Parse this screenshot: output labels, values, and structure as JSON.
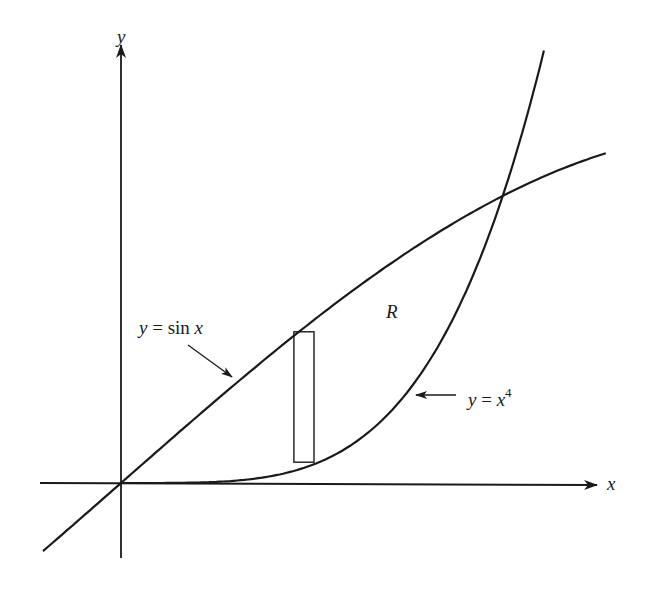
{
  "figure": {
    "axis_labels": {
      "x": "x",
      "y": "y"
    },
    "curve_labels": {
      "sin": {
        "lhs": "y",
        "eq": " = ",
        "fn": "sin ",
        "var": "x"
      },
      "quartic": {
        "lhs": "y",
        "eq": " = ",
        "base": "x",
        "exp": "4"
      }
    },
    "region_label": "R",
    "colors": {
      "ink": "#1a1a1a",
      "background": "#ffffff"
    }
  },
  "chart_data": {
    "type": "line",
    "title": "",
    "xlabel": "x",
    "ylabel": "y",
    "grid": false,
    "legend": "none (curves labeled inline with arrows)",
    "series": [
      {
        "name": "y = sin x",
        "x_range": [
          -0.194,
          1.206
        ],
        "function": "sin(x)"
      },
      {
        "name": "y = x^4",
        "x_range": [
          0.0,
          1.052
        ],
        "function": "x^4"
      }
    ],
    "intersection_points": [
      [
        0,
        0
      ],
      [
        0.9496,
        0.8131
      ]
    ],
    "shaded_region": {
      "label": "R",
      "between": [
        "y = sin x",
        "y = x^4"
      ],
      "x_from": 0,
      "x_to": 0.9496
    },
    "representative_rectangle": {
      "x_left": 0.43,
      "x_right": 0.48
    },
    "xlim": [
      -0.2,
      1.19
    ],
    "ylim": [
      -0.21,
      1.24
    ]
  }
}
